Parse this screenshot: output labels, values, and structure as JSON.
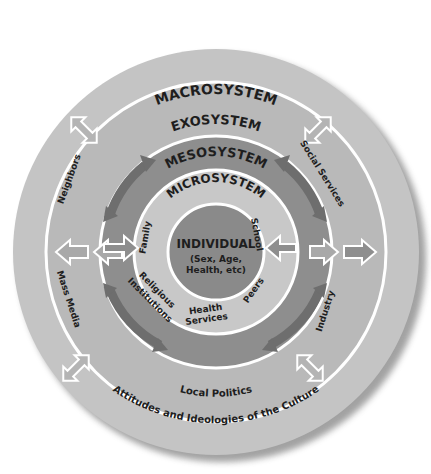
{
  "diagram": {
    "colors": {
      "macro_ring": "#c4c4c4",
      "exo_ring": "#b9b9b9",
      "meso_ring": "#8e8e8e",
      "micro_ring": "#c8c8c8",
      "individual": "#8a8a8a",
      "ring_stroke": "#ffffff",
      "arrow_dark": "#6e6e6e",
      "arrow_light": "#a9a9a9",
      "text": "#1e1e1e",
      "shadow": "#7a7a7a"
    },
    "individual": {
      "title": "INDIVIDUAL",
      "line1": "(Sex, Age,",
      "line2": "Health, etc)"
    },
    "microsystem": {
      "label": "MICROSYSTEM",
      "items": [
        "Family",
        "School",
        "Religious",
        "Institutions",
        "Health",
        "Services",
        "Peers"
      ]
    },
    "mesosystem": {
      "label": "MESOSYSTEM"
    },
    "exosystem": {
      "label": "EXOSYSTEM",
      "items": [
        "Neighbors",
        "Social Services",
        "Mass Media",
        "Industry",
        "Local Politics"
      ]
    },
    "macrosystem": {
      "label": "MACROSYSTEM",
      "caption": "Attitudes and Ideologies of the Culture"
    }
  }
}
